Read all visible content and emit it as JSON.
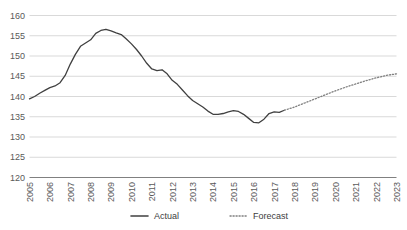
{
  "chart_data": {
    "type": "line",
    "title": "",
    "xlabel": "",
    "ylabel": "",
    "ylim": [
      120,
      160
    ],
    "ytick_step": 5,
    "yticks": [
      "120",
      "125",
      "130",
      "135",
      "140",
      "145",
      "150",
      "155",
      "160"
    ],
    "xticks": [
      "2005",
      "2006",
      "2007",
      "2008",
      "2009",
      "2010",
      "2011",
      "2012",
      "2013",
      "2014",
      "2015",
      "2016",
      "2017",
      "2018",
      "2019",
      "2020",
      "2021",
      "2022",
      "2023"
    ],
    "xlim": [
      2005,
      2023
    ],
    "grid": "horizontal",
    "legend_position": "bottom",
    "series": [
      {
        "name": "Actual",
        "style": "solid",
        "color": "#404040",
        "x": [
          2005.0,
          2005.25,
          2005.5,
          2005.75,
          2006.0,
          2006.25,
          2006.5,
          2006.75,
          2007.0,
          2007.25,
          2007.5,
          2007.75,
          2008.0,
          2008.25,
          2008.5,
          2008.75,
          2009.0,
          2009.25,
          2009.5,
          2009.75,
          2010.0,
          2010.25,
          2010.5,
          2010.75,
          2011.0,
          2011.25,
          2011.5,
          2011.75,
          2012.0,
          2012.25,
          2012.5,
          2012.75,
          2013.0,
          2013.25,
          2013.5,
          2013.75,
          2014.0,
          2014.25,
          2014.5,
          2014.75,
          2015.0,
          2015.25,
          2015.5,
          2015.75,
          2016.0,
          2016.25,
          2016.5,
          2016.75,
          2017.0,
          2017.25,
          2017.5
        ],
        "values": [
          139.4,
          140.0,
          140.8,
          141.5,
          142.2,
          142.6,
          143.4,
          145.2,
          148.0,
          150.4,
          152.4,
          153.2,
          154.0,
          155.6,
          156.3,
          156.6,
          156.2,
          155.7,
          155.3,
          154.2,
          153.0,
          151.6,
          150.0,
          148.2,
          146.8,
          146.4,
          146.6,
          145.6,
          144.0,
          143.0,
          141.6,
          140.2,
          139.0,
          138.2,
          137.4,
          136.4,
          135.6,
          135.6,
          135.8,
          136.2,
          136.5,
          136.3,
          135.6,
          134.6,
          133.6,
          133.5,
          134.4,
          135.8,
          136.2,
          136.1,
          136.6
        ]
      },
      {
        "name": "Forecast",
        "style": "dotted",
        "color": "#808080",
        "x": [
          2017.5,
          2018.0,
          2018.5,
          2019.0,
          2019.5,
          2020.0,
          2020.5,
          2021.0,
          2021.5,
          2022.0,
          2022.5,
          2023.0
        ],
        "values": [
          136.6,
          137.4,
          138.4,
          139.4,
          140.4,
          141.4,
          142.3,
          143.1,
          143.9,
          144.6,
          145.2,
          145.6
        ]
      }
    ],
    "legend": [
      {
        "label": "Actual",
        "style": "solid",
        "color": "#404040"
      },
      {
        "label": "Forecast",
        "style": "dotted",
        "color": "#808080"
      }
    ]
  }
}
